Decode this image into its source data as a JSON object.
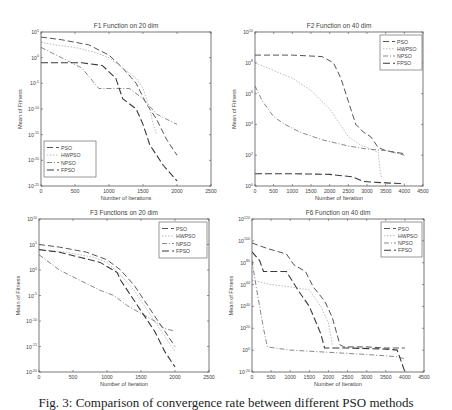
{
  "figure": {
    "caption": "Fig. 3: Comparison of convergence rate between different PSO methods"
  },
  "styles": {
    "PSO": {
      "color": "#555555",
      "dash": "6,3",
      "width": 1.0
    },
    "HWPSO": {
      "color": "#bdbdbd",
      "dash": "1.5,1.5",
      "width": 1.0
    },
    "NPSO": {
      "color": "#7a7a7a",
      "dash": "5,2,1,2",
      "width": 0.9
    },
    "FPSO": {
      "color": "#3a3a3a",
      "dash": "7,3",
      "width": 1.1
    }
  },
  "chart_data": [
    {
      "id": "f1",
      "type": "line",
      "title": "F1 Function on 20 dim",
      "xlabel": "Number of Iterations",
      "ylabel": "Mean of Fitness",
      "yscale": "log",
      "box": {
        "x0": 41,
        "y0": 32,
        "x1": 211,
        "y1": 186
      },
      "xlim": [
        0,
        2500
      ],
      "xticks": [
        0,
        500,
        1000,
        1500,
        2000,
        2500
      ],
      "ylim_exp": [
        -25,
        5
      ],
      "yticks_exp": [
        5,
        0,
        -5,
        -10,
        -15,
        -20,
        -25
      ],
      "grid": false,
      "legend": {
        "position": "lower-left",
        "x": 44,
        "y": 141,
        "w": 52,
        "h": 36
      },
      "series": [
        {
          "name": "PSO",
          "x": [
            0,
            300,
            700,
            1000,
            1200,
            1400,
            1550,
            1700,
            1850,
            2000
          ],
          "y_exp": [
            4,
            3.5,
            2.5,
            0.5,
            -2,
            -5,
            -9,
            -12,
            -16,
            -19
          ]
        },
        {
          "name": "HWPSO",
          "x": [
            0,
            200,
            500,
            800,
            1000,
            1200,
            1400,
            1500,
            1600,
            1650,
            1700
          ],
          "y_exp": [
            3,
            2.5,
            2,
            1,
            0,
            -2,
            -4,
            -6,
            -10,
            -13,
            -15
          ]
        },
        {
          "name": "NPSO",
          "x": [
            0,
            300,
            600,
            850,
            1000,
            1300,
            1500,
            1700,
            1850,
            2000
          ],
          "y_exp": [
            2,
            0,
            -2,
            -6,
            -6,
            -6,
            -8,
            -11,
            -12,
            -13
          ]
        },
        {
          "name": "FPSO",
          "x": [
            0,
            300,
            600,
            900,
            1100,
            1200,
            1400,
            1500,
            1600,
            1800,
            2000
          ],
          "y_exp": [
            -1,
            -1,
            -1,
            -1.5,
            -4,
            -8,
            -10,
            -13,
            -17,
            -21,
            -24
          ]
        }
      ]
    },
    {
      "id": "f2",
      "type": "line",
      "title": "F2 Function on 40 dim",
      "xlabel": "Number of Iteration",
      "ylabel": "Mean of Fitness",
      "yscale": "log",
      "box": {
        "x0": 255,
        "y0": 32,
        "x1": 423,
        "y1": 186
      },
      "xlim": [
        0,
        4500
      ],
      "xticks": [
        0,
        500,
        1000,
        1500,
        2000,
        2500,
        3000,
        3500,
        4000,
        4500
      ],
      "ylim_exp": [
        0,
        10
      ],
      "yticks_exp": [
        10,
        8,
        6,
        4,
        2,
        0
      ],
      "grid": false,
      "legend": {
        "position": "upper-right",
        "x": 380,
        "y": 35,
        "w": 42,
        "h": 35
      },
      "series": [
        {
          "name": "PSO",
          "x": [
            0,
            1000,
            1800,
            2100,
            2300,
            2500,
            2700,
            2900,
            3100,
            3300,
            3500,
            4000
          ],
          "y_exp": [
            8.5,
            8.5,
            8.4,
            8,
            7,
            5.5,
            4,
            3.5,
            3.2,
            2.5,
            2.3,
            2.1
          ]
        },
        {
          "name": "HWPSO",
          "x": [
            0,
            500,
            1000,
            1500,
            2000,
            2500,
            2800,
            3000,
            3300,
            3350,
            3400
          ],
          "y_exp": [
            8,
            7.5,
            7,
            6.2,
            5,
            3.2,
            2.7,
            2.5,
            2.2,
            1,
            0.5
          ]
        },
        {
          "name": "NPSO",
          "x": [
            0,
            200,
            500,
            800,
            1200,
            1800,
            2500,
            3000,
            3500,
            4000
          ],
          "y_exp": [
            6.5,
            5.5,
            4.5,
            4,
            3.5,
            3,
            2.6,
            2.4,
            2.3,
            2
          ]
        },
        {
          "name": "FPSO",
          "x": [
            0,
            1000,
            2000,
            2600,
            2900,
            3200,
            3500,
            4000
          ],
          "y_exp": [
            0.8,
            0.8,
            0.75,
            0.6,
            0.3,
            0.25,
            0.2,
            0.15
          ]
        }
      ]
    },
    {
      "id": "f3",
      "type": "line",
      "title": "F3 Functions on 20 dim",
      "xlabel": "Number of Iteration",
      "ylabel": "Mean of Fitness",
      "yscale": "log",
      "box": {
        "x0": 39,
        "y0": 219,
        "x1": 209,
        "y1": 372
      },
      "xlim": [
        0,
        2500
      ],
      "xticks": [
        0,
        500,
        1000,
        1500,
        2000,
        2500
      ],
      "ylim_exp": [
        -20,
        10
      ],
      "yticks_exp": [
        10,
        5,
        0,
        -5,
        -10,
        -15,
        -20
      ],
      "grid": false,
      "legend": {
        "position": "upper-right",
        "x": 159,
        "y": 222,
        "w": 48,
        "h": 36
      },
      "series": [
        {
          "name": "PSO",
          "x": [
            0,
            300,
            700,
            1000,
            1200,
            1400,
            1550,
            1700,
            1850,
            2000
          ],
          "y_exp": [
            5,
            4.5,
            3.5,
            2,
            0,
            -3,
            -6,
            -9,
            -12,
            -15
          ]
        },
        {
          "name": "HWPSO",
          "x": [
            0,
            400,
            800,
            1000,
            1200,
            1400,
            1600,
            1800,
            2000
          ],
          "y_exp": [
            4,
            3.5,
            2.5,
            1.5,
            -1,
            -4,
            -8,
            -12,
            -16
          ]
        },
        {
          "name": "NPSO",
          "x": [
            0,
            300,
            600,
            900,
            1100,
            1300,
            1500,
            1700,
            1850,
            2000
          ],
          "y_exp": [
            3,
            0,
            -2,
            -4,
            -5,
            -7,
            -8.5,
            -10,
            -11.5,
            -12
          ]
        },
        {
          "name": "FPSO",
          "x": [
            0,
            300,
            600,
            900,
            1150,
            1200,
            1300,
            1500,
            1700,
            1850,
            2000
          ],
          "y_exp": [
            4,
            3.5,
            2.5,
            1.5,
            -0.5,
            -2,
            -4,
            -8,
            -12,
            -16,
            -19
          ]
        }
      ]
    },
    {
      "id": "f6",
      "type": "line",
      "title": "F6 Function on 40 dim",
      "xlabel": "Number of Iteration",
      "ylabel": "Mean of Fitness",
      "yscale": "log",
      "box": {
        "x0": 252,
        "y0": 219,
        "x1": 424,
        "y1": 372
      },
      "xlim": [
        0,
        4500
      ],
      "xticks": [
        0,
        500,
        1000,
        1500,
        2000,
        2500,
        3000,
        3500,
        4000,
        4500
      ],
      "ylim_exp": [
        -20,
        120
      ],
      "yticks_exp": [
        120,
        100,
        80,
        60,
        40,
        20,
        0,
        -20
      ],
      "grid": false,
      "legend": {
        "position": "upper-right",
        "x": 381,
        "y": 222,
        "w": 41,
        "h": 35
      },
      "series": [
        {
          "name": "PSO",
          "x": [
            0,
            400,
            900,
            1100,
            1400,
            1600,
            1900,
            2100,
            2300,
            2400,
            3000,
            3500,
            4000
          ],
          "y_exp": [
            98,
            93,
            88,
            78,
            72,
            58,
            45,
            30,
            5,
            3,
            3,
            2,
            2
          ]
        },
        {
          "name": "HWPSO",
          "x": [
            0,
            500,
            1000,
            1500,
            1800,
            2000,
            2100
          ],
          "y_exp": [
            64,
            60,
            58,
            55,
            40,
            25,
            5
          ]
        },
        {
          "name": "NPSO",
          "x": [
            0,
            100,
            200,
            300,
            400,
            1000,
            2000,
            3000,
            3800,
            4000
          ],
          "y_exp": [
            82,
            60,
            40,
            20,
            3,
            0,
            -2,
            -4,
            -6,
            -8
          ]
        },
        {
          "name": "FPSO",
          "x": [
            0,
            200,
            300,
            900,
            1200,
            1500,
            1800,
            1900,
            2500,
            3500,
            3800,
            3900,
            4000
          ],
          "y_exp": [
            90,
            82,
            72,
            72,
            55,
            40,
            15,
            2,
            2,
            1,
            0,
            -10,
            -20
          ]
        }
      ]
    }
  ]
}
